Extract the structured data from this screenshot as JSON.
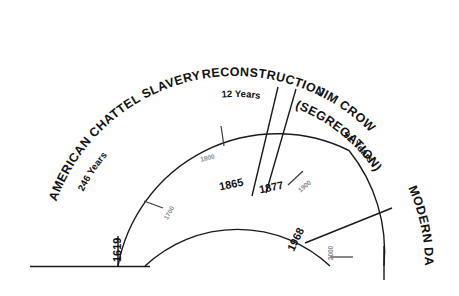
{
  "diagram": {
    "type": "radial-timeline",
    "background_color": "#ffffff",
    "line_color": "#1a1a1a",
    "minor_label_color": "#8c8c8c"
  },
  "eras": [
    {
      "id": "slavery",
      "label": "AMERICAN CHATTEL SLAVERY",
      "duration": "246 Years",
      "start_year": "1619",
      "end_year": "1865"
    },
    {
      "id": "reconstruction",
      "label": "RECONSTRUCTION",
      "duration": "12 Years",
      "start_year": "1865",
      "end_year": "1877"
    },
    {
      "id": "jim-crow",
      "label": "JIM CROW",
      "label_line2": "(SEGREGATION)",
      "duration": "91 Years",
      "start_year": "1877",
      "end_year": "1968"
    },
    {
      "id": "modern-day",
      "label": "MODERN DAY",
      "duration": "",
      "start_year": "1968",
      "end_year": ""
    }
  ],
  "boundary_years": [
    {
      "id": "y1619",
      "value": "1619"
    },
    {
      "id": "y1865",
      "value": "1865"
    },
    {
      "id": "y1877",
      "value": "1877"
    },
    {
      "id": "y1968",
      "value": "1968"
    }
  ],
  "century_ticks": [
    {
      "id": "c1700",
      "value": "1700"
    },
    {
      "id": "c1800",
      "value": "1800"
    },
    {
      "id": "c1900",
      "value": "1900"
    },
    {
      "id": "c2000",
      "value": "2000"
    }
  ]
}
